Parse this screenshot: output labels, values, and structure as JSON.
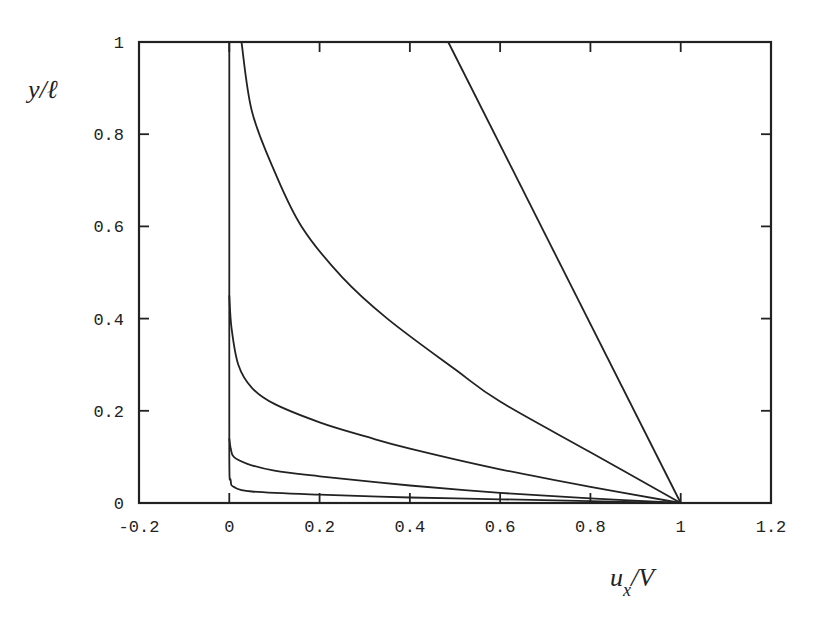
{
  "chart_data": {
    "type": "line",
    "title": "",
    "xlabel": "u_x/V",
    "ylabel": "y/ℓ",
    "xlim": [
      -0.2,
      1.2
    ],
    "ylim": [
      0,
      1
    ],
    "grid": false,
    "legend": null,
    "x_ticks": [
      "-0.2",
      "0",
      "0.2",
      "0.4",
      "0.6",
      "0.8",
      "1",
      "1.2"
    ],
    "y_ticks": [
      "0",
      "0.2",
      "0.4",
      "0.6",
      "0.8",
      "1"
    ],
    "series": [
      {
        "name": "profile-1",
        "points": [
          [
            0.0,
            1.0
          ],
          [
            0.0,
            0.5
          ],
          [
            0.0,
            0.1
          ],
          [
            0.003,
            0.05
          ],
          [
            0.01,
            0.035
          ],
          [
            0.05,
            0.025
          ],
          [
            0.2,
            0.018
          ],
          [
            0.4,
            0.012
          ],
          [
            0.6,
            0.008
          ],
          [
            0.8,
            0.004
          ],
          [
            1.0,
            0.0
          ]
        ]
      },
      {
        "name": "profile-2",
        "points": [
          [
            0.0,
            0.14
          ],
          [
            0.003,
            0.12
          ],
          [
            0.01,
            0.1
          ],
          [
            0.04,
            0.085
          ],
          [
            0.1,
            0.07
          ],
          [
            0.2,
            0.058
          ],
          [
            0.4,
            0.038
          ],
          [
            0.6,
            0.022
          ],
          [
            0.8,
            0.01
          ],
          [
            1.0,
            0.0
          ]
        ]
      },
      {
        "name": "profile-3",
        "points": [
          [
            0.0,
            0.45
          ],
          [
            0.005,
            0.38
          ],
          [
            0.02,
            0.3
          ],
          [
            0.05,
            0.25
          ],
          [
            0.1,
            0.215
          ],
          [
            0.2,
            0.175
          ],
          [
            0.3,
            0.145
          ],
          [
            0.4,
            0.118
          ],
          [
            0.6,
            0.073
          ],
          [
            0.8,
            0.035
          ],
          [
            1.0,
            0.0
          ]
        ]
      },
      {
        "name": "profile-4",
        "points": [
          [
            0.027,
            1.0
          ],
          [
            0.05,
            0.85
          ],
          [
            0.1,
            0.72
          ],
          [
            0.16,
            0.6
          ],
          [
            0.25,
            0.49
          ],
          [
            0.35,
            0.4
          ],
          [
            0.5,
            0.29
          ],
          [
            0.6,
            0.22
          ],
          [
            0.8,
            0.11
          ],
          [
            1.0,
            0.0
          ]
        ]
      },
      {
        "name": "profile-5",
        "points": [
          [
            0.485,
            1.0
          ],
          [
            1.0,
            0.0
          ]
        ]
      }
    ]
  },
  "axes": {
    "xlabel_main": "u",
    "xlabel_sub": "x",
    "xlabel_rest": "/V",
    "ylabel": "y/ℓ"
  }
}
